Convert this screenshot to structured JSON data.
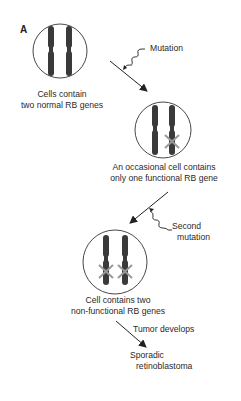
{
  "panel_label": "A",
  "steps": [
    {
      "caption_line1": "Cells contain",
      "caption_line2": "two normal RB genes"
    },
    {
      "caption_line1": "An occasional cell contains",
      "caption_line2": "only one functional RB gene"
    },
    {
      "caption_line1": "Cell contains two",
      "caption_line2": "non-functional RB genes"
    }
  ],
  "transitions": [
    {
      "label_line1": "Mutation"
    },
    {
      "label_line1": "Second",
      "label_line2": "mutation"
    },
    {
      "label_line1": "Tumor develops"
    }
  ],
  "outcome": {
    "line1": "Sporadic",
    "line2": "retinoblastoma"
  },
  "colors": {
    "chromosome": "#3a3a3a",
    "cross": "#999999",
    "line": "#222222"
  }
}
